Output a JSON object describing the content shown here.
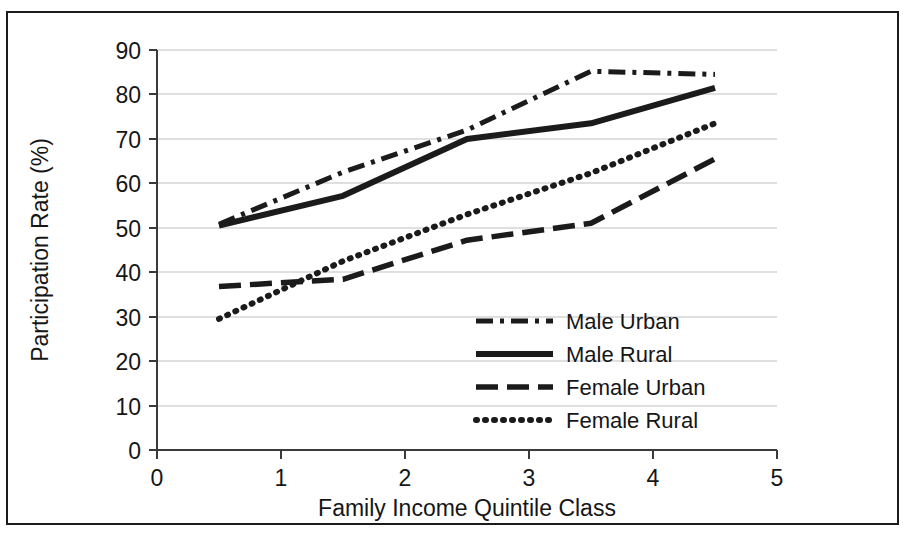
{
  "chart_data": {
    "type": "line",
    "title": "",
    "xlabel": "Family Income Quintile Class",
    "ylabel": "Participation Rate (%)",
    "xlim": [
      0,
      5
    ],
    "ylim": [
      0,
      90
    ],
    "x": [
      0.5,
      1.5,
      2.5,
      3.5,
      4.5
    ],
    "xticks": [
      "0",
      "1",
      "2",
      "3",
      "4",
      "5"
    ],
    "xtick_values": [
      0,
      1,
      2,
      3,
      4,
      5
    ],
    "yticks": [
      "0",
      "10",
      "20",
      "30",
      "40",
      "50",
      "60",
      "70",
      "80",
      "90"
    ],
    "ytick_values": [
      0,
      10,
      20,
      30,
      40,
      50,
      60,
      70,
      80,
      90
    ],
    "grid": "horizontal",
    "legend_position": "center-right-inside",
    "series": [
      {
        "name": "Male Urban",
        "style": "dash-dot",
        "color": "#1b1b1b",
        "values": [
          50.8,
          62.5,
          72.0,
          85.2,
          84.5
        ]
      },
      {
        "name": "Male Rural",
        "style": "solid",
        "color": "#1b1b1b",
        "values": [
          50.5,
          57.2,
          70.0,
          73.5,
          81.5
        ]
      },
      {
        "name": "Female Urban",
        "style": "long-dash",
        "color": "#1b1b1b",
        "values": [
          36.8,
          38.4,
          47.2,
          51.0,
          65.5
        ]
      },
      {
        "name": "Female Rural",
        "style": "dotted",
        "color": "#1b1b1b",
        "values": [
          29.5,
          42.5,
          53.0,
          62.3,
          73.5
        ]
      }
    ]
  },
  "axes": {
    "x_title": "Family Income Quintile Class",
    "y_title": "Participation Rate (%)",
    "x_tick_0": "0",
    "x_tick_1": "1",
    "x_tick_2": "2",
    "x_tick_3": "3",
    "x_tick_4": "4",
    "x_tick_5": "5",
    "y_tick_0": "0",
    "y_tick_10": "10",
    "y_tick_20": "20",
    "y_tick_30": "30",
    "y_tick_40": "40",
    "y_tick_50": "50",
    "y_tick_60": "60",
    "y_tick_70": "70",
    "y_tick_80": "80",
    "y_tick_90": "90"
  },
  "legend": {
    "items": [
      {
        "label": "Male Urban",
        "style": "dash-dot"
      },
      {
        "label": "Male Rural",
        "style": "solid"
      },
      {
        "label": "Female Urban",
        "style": "long-dash"
      },
      {
        "label": "Female Rural",
        "style": "dotted"
      }
    ]
  },
  "colors": {
    "ink": "#1b1b1b",
    "grid": "#bfbfbf",
    "axis": "#3a3a3a",
    "background": "#ffffff"
  }
}
